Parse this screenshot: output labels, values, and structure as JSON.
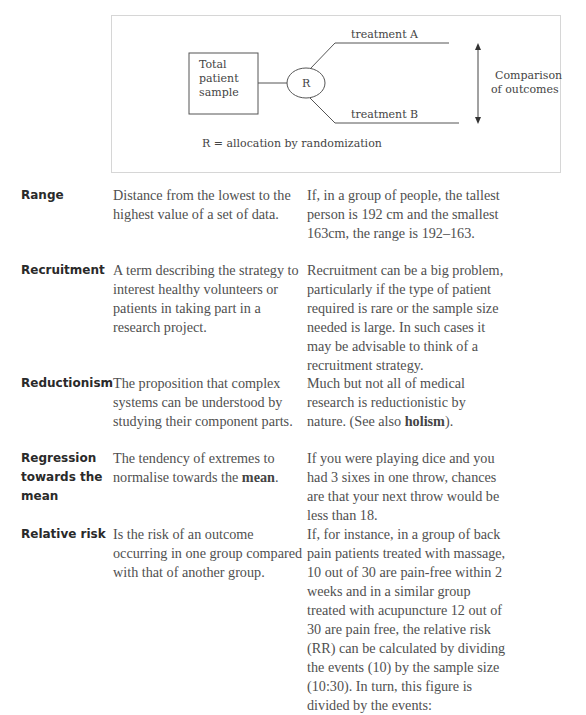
{
  "figure": {
    "box_label_lines": [
      "Total",
      "patient",
      "sample"
    ],
    "node_label": "R",
    "branch_a": "treatment A",
    "branch_b": "treatment B",
    "outcome_lines": [
      "Comparison",
      "of outcomes"
    ],
    "caption": "R = allocation by randomization"
  },
  "entries": [
    {
      "term_lines": [
        "Range"
      ],
      "definition": "Distance from the lowest to the highest value of a set of data.",
      "example": "If, in a group of people, the tallest person is 192 cm and the smallest 163cm, the range is 192–163."
    },
    {
      "term_lines": [
        "Recruitment"
      ],
      "definition": "A term describing the strategy to interest healthy volunteers or patients in taking part in a research project.",
      "example": "Recruitment can be a big problem, particularly if the type of patient required is rare or the sample size needed is large. In such cases it may be advisable to think of a recruitment strategy."
    },
    {
      "term_lines": [
        "Reductionism"
      ],
      "definition": "The proposition that complex systems can be understood by studying their component parts.",
      "example_before": "Much but not all of medical research is reductionistic by nature. (See also ",
      "example_keyword": "holism",
      "example_after": ")."
    },
    {
      "term_lines": [
        "Regression",
        "towards the",
        "mean"
      ],
      "definition_before": "The tendency of extremes to normalise towards the ",
      "definition_keyword": "mean",
      "definition_after": ".",
      "example": "If you were playing dice and you had 3 sixes in one throw, chances are that your next throw would be less than 18."
    },
    {
      "term_lines": [
        "Relative risk"
      ],
      "definition": "Is the risk of an outcome occurring in one group compared with that of another group.",
      "example": "If, for instance, in a group of back pain patients treated with massage, 10 out of 30 are pain-free within 2 weeks and in a similar group treated with acupuncture 12 out of 30 are pain free, the relative risk (RR) can be calculated by dividing the events (10) by the sample size (10:30). In turn, this figure is divided by the events:"
    }
  ]
}
